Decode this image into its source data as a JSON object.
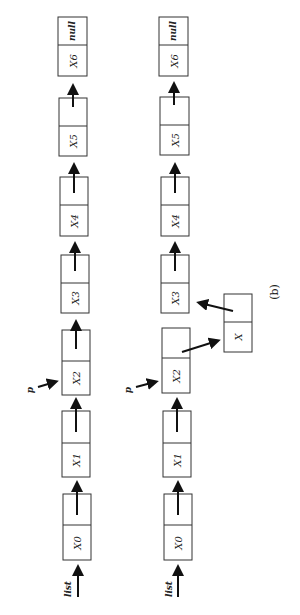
{
  "figure": {
    "caption": "(b)",
    "top_list": {
      "head_label": "list",
      "pointer_label": "p",
      "nodes": [
        {
          "value": "X0",
          "next": ""
        },
        {
          "value": "X1",
          "next": ""
        },
        {
          "value": "X2",
          "next": ""
        },
        {
          "value": "X3",
          "next": ""
        },
        {
          "value": "X4",
          "next": ""
        },
        {
          "value": "X5",
          "next": ""
        },
        {
          "value": "X6",
          "next": "null"
        }
      ]
    },
    "bottom_list": {
      "head_label": "list",
      "pointer_label": "p",
      "nodes": [
        {
          "value": "X0",
          "next": ""
        },
        {
          "value": "X1",
          "next": ""
        },
        {
          "value": "X2",
          "next": ""
        },
        {
          "value": "X3",
          "next": ""
        },
        {
          "value": "X4",
          "next": ""
        },
        {
          "value": "X5",
          "next": ""
        },
        {
          "value": "X6",
          "next": "null"
        }
      ],
      "inserted_node": {
        "value": "X",
        "next": ""
      }
    }
  }
}
